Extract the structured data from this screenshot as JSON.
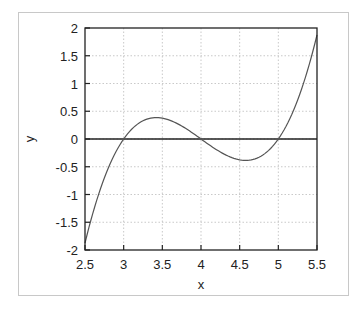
{
  "chart_data": {
    "type": "line",
    "title": "",
    "xlabel": "x",
    "ylabel": "y",
    "xlim": [
      2.5,
      5.5
    ],
    "ylim": [
      -2,
      2
    ],
    "xticks": [
      "2.5",
      "3",
      "3.5",
      "4",
      "4.5",
      "5",
      "5.5"
    ],
    "yticks": [
      "2",
      "1.5",
      "1",
      "0.5",
      "0",
      "-0.5",
      "-1",
      "-1.5",
      "-2"
    ],
    "grid": true,
    "legend": null,
    "zero_line": true,
    "series": [
      {
        "name": "y = (x-3)(x-4)(x-5)",
        "color": "#555555",
        "x": [
          2.5,
          2.75,
          3.0,
          3.25,
          3.42,
          3.5,
          3.75,
          4.0,
          4.25,
          4.5,
          4.58,
          4.75,
          5.0,
          5.25,
          5.5
        ],
        "y": [
          -1.875,
          -0.703,
          0.0,
          0.328,
          0.385,
          0.375,
          0.234,
          0.0,
          -0.234,
          -0.375,
          -0.385,
          -0.328,
          0.0,
          0.703,
          1.875
        ]
      }
    ]
  }
}
